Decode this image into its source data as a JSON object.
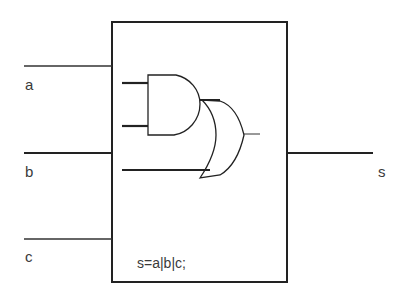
{
  "diagram": {
    "type": "logic-circuit",
    "inputs": [
      {
        "name": "a",
        "label": "a"
      },
      {
        "name": "b",
        "label": "b"
      },
      {
        "name": "c",
        "label": "c"
      }
    ],
    "output": {
      "name": "s",
      "label": "s"
    },
    "module": {
      "expression": "s=a|b|c;",
      "gates": [
        {
          "type": "AND",
          "inputs": 2
        },
        {
          "type": "OR",
          "inputs": 2
        }
      ]
    },
    "colors": {
      "line": "#222222",
      "text": "#3a3a3a",
      "background": "#ffffff"
    }
  }
}
